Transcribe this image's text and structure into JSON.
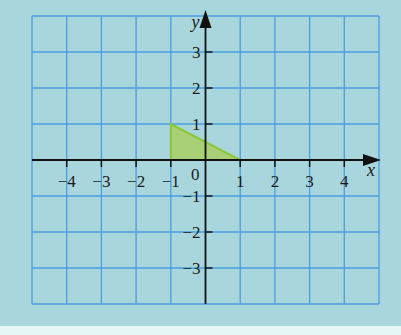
{
  "chart_data": {
    "type": "scatter",
    "title": "",
    "xlabel": "x",
    "ylabel": "y",
    "xlim": [
      -5,
      5
    ],
    "ylim": [
      -4,
      4
    ],
    "grid": true,
    "x_ticks": [
      -4,
      -3,
      -2,
      -1,
      1,
      2,
      3,
      4
    ],
    "x_tick_labels": [
      "−4",
      "−3",
      "−2",
      "−1",
      "1",
      "2",
      "3",
      "4"
    ],
    "y_ticks": [
      3,
      2,
      1,
      -1,
      -2,
      -3
    ],
    "y_tick_labels": [
      "3",
      "2",
      "1",
      "−1",
      "−2",
      "−3"
    ],
    "origin_label": "0",
    "shapes": [
      {
        "name": "triangle",
        "type": "polygon",
        "vertices": [
          [
            -1,
            0
          ],
          [
            -1,
            1
          ],
          [
            1,
            0
          ]
        ],
        "fill": "#a8cf6a",
        "stroke": "#8cc63f"
      }
    ]
  },
  "colors": {
    "background": "#a9d6dc",
    "page": "#e6f5f5",
    "grid": "#4a9ee0",
    "axis": "#111111",
    "triangle_fill": "#a8cf6a",
    "triangle_stroke": "#8cc63f"
  }
}
